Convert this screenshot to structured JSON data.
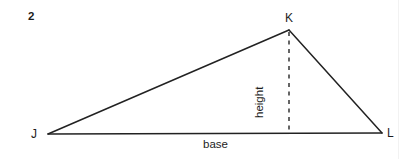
{
  "page": {
    "background_color": "#ffffff",
    "width": 405,
    "height": 159
  },
  "problem": {
    "number": "2"
  },
  "figure": {
    "type": "geometry-diagram",
    "shape": "triangle",
    "stroke_color": "#222222",
    "stroke_width": 1.5,
    "dash_color": "#333333",
    "vertices": [
      {
        "name": "J",
        "label": "J",
        "x": 48,
        "y": 134
      },
      {
        "name": "K",
        "label": "K",
        "x": 289,
        "y": 30
      },
      {
        "name": "L",
        "label": "L",
        "x": 382,
        "y": 133
      }
    ],
    "altitude": {
      "label": "height",
      "from": {
        "x": 289,
        "y": 31
      },
      "to": {
        "x": 289,
        "y": 133
      },
      "style": "dashed"
    },
    "base": {
      "label": "base",
      "from": {
        "x": 48,
        "y": 134
      },
      "to": {
        "x": 382,
        "y": 133
      }
    }
  }
}
